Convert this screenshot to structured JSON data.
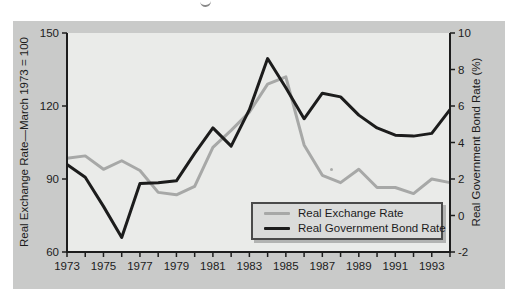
{
  "chart_data": {
    "type": "line",
    "x": [
      1973,
      1974,
      1975,
      1976,
      1977,
      1978,
      1979,
      1980,
      1981,
      1982,
      1983,
      1984,
      1985,
      1986,
      1987,
      1988,
      1989,
      1990,
      1991,
      1992,
      1993,
      1994
    ],
    "x_tick_labels": [
      "1973",
      "1975",
      "1977",
      "1979",
      "1981",
      "1983",
      "1985",
      "1987",
      "1989",
      "1991",
      "1993"
    ],
    "left_axis": {
      "title": "Real Exchange Rate—March 1973 = 100",
      "min": 60,
      "max": 150,
      "ticks": [
        60,
        90,
        120,
        150
      ],
      "tick_labels": [
        "60",
        "90",
        "120",
        "150"
      ]
    },
    "right_axis": {
      "title": "Real Government Bond Rate (%)",
      "min": -2,
      "max": 10,
      "ticks": [
        -2,
        0,
        2,
        4,
        6,
        8,
        10
      ],
      "tick_labels": [
        "-2",
        "0",
        "2",
        "4",
        "6",
        "8",
        "10"
      ]
    },
    "series": [
      {
        "name": "Real Exchange Rate",
        "axis": "left",
        "color": "#a7a8a7",
        "width": 3,
        "values": [
          98.5,
          99.5,
          94,
          97.5,
          93.5,
          84.5,
          83.5,
          87,
          103,
          110,
          117.5,
          129,
          132,
          104,
          91.5,
          88.5,
          94,
          86.5,
          86.5,
          84,
          90,
          88.5
        ]
      },
      {
        "name": "Real Government Bond Rate",
        "axis": "right",
        "color": "#1c1c1c",
        "width": 3,
        "values": [
          2.8,
          2.1,
          0.5,
          -1.2,
          1.75,
          1.8,
          1.9,
          3.4,
          4.8,
          3.8,
          5.8,
          8.6,
          7.0,
          5.3,
          6.7,
          6.5,
          5.5,
          4.8,
          4.4,
          4.35,
          4.5,
          5.8
        ]
      }
    ],
    "legend_position": "inside-bottom-right",
    "grid": false
  },
  "colors": {
    "page_bg": "#ffffff",
    "card_bg": "#c9cac9",
    "plot_bg": "#eaebe9",
    "axis": "#1c1c1c",
    "text": "#1c1c1c",
    "legend_bg": "#dadbda",
    "legend_border": "#4a4a4a"
  }
}
